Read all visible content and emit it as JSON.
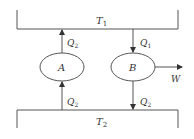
{
  "diagram": {
    "type": "heat-engine-refrigerator",
    "colors": {
      "line": "#555555",
      "text": "#333333",
      "background": "#ffffff"
    },
    "reservoirs": {
      "hot": {
        "label": "T",
        "subscript": "1"
      },
      "cold": {
        "label": "T",
        "subscript": "2"
      }
    },
    "devices": {
      "a": {
        "label": "A"
      },
      "b": {
        "label": "B"
      }
    },
    "flows": {
      "a_to_hot": {
        "label": "Q",
        "subscript": "2"
      },
      "hot_to_b": {
        "label": "Q",
        "subscript": "1"
      },
      "cold_to_a": {
        "label": "Q",
        "subscript": "2"
      },
      "b_to_cold": {
        "label": "Q",
        "subscript": "2"
      },
      "work_out": {
        "label": "W"
      }
    }
  }
}
